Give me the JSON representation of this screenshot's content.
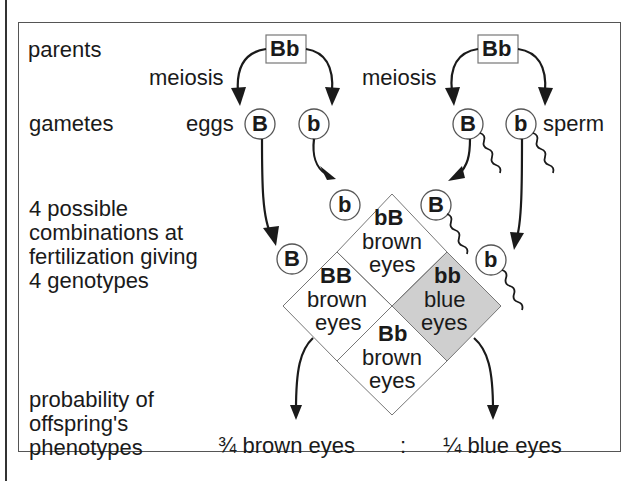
{
  "labels": {
    "parents": "parents",
    "gametes": "gametes",
    "combinations": [
      "4 possible",
      "combinations at",
      "fertilization giving",
      "4 genotypes"
    ],
    "probability": [
      "probability of",
      "offspring's",
      "phenotypes"
    ]
  },
  "female": {
    "genotype": "Bb",
    "process": "meiosis",
    "gamete_label": "eggs",
    "gametes": [
      "B",
      "b"
    ]
  },
  "male": {
    "genotype": "Bb",
    "process": "meiosis",
    "gamete_label": "sperm",
    "gametes": [
      "B",
      "b"
    ]
  },
  "cells": {
    "top": {
      "genotype": "bB",
      "line1": "brown",
      "line2": "eyes"
    },
    "left": {
      "genotype": "BB",
      "line1": "brown",
      "line2": "eyes"
    },
    "right": {
      "genotype": "bb",
      "line1": "blue",
      "line2": "eyes"
    },
    "bottom": {
      "genotype": "Bb",
      "line1": "brown",
      "line2": "eyes"
    }
  },
  "result": {
    "brown": "¾ brown eyes",
    "sep": ":",
    "blue": "¼ blue eyes"
  },
  "colors": {
    "shaded": "#cfcfcf",
    "line": "#777777",
    "ink": "#1a1a1a"
  }
}
